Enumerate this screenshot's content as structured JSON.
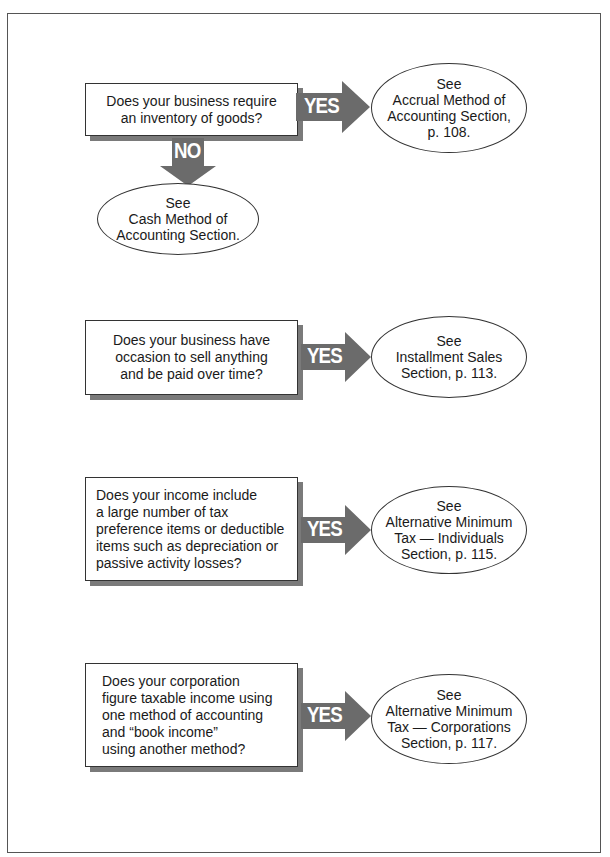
{
  "flowchart": {
    "nodes": [
      {
        "question": [
          "Does your business require",
          "an inventory of goods?"
        ],
        "yes_label": "YES",
        "yes_target": [
          "See",
          "Accrual Method of",
          "Accounting Section,",
          "p. 108."
        ],
        "no_label": "NO",
        "no_target": [
          "See",
          "Cash Method of",
          "Accounting Section."
        ]
      },
      {
        "question": [
          "Does your business have",
          "occasion to sell anything",
          "and be paid over time?"
        ],
        "yes_label": "YES",
        "yes_target": [
          "See",
          "Installment Sales",
          "Section, p. 113."
        ]
      },
      {
        "question": [
          "Does your income include",
          "a large number of tax",
          "preference items or deductible",
          "items such as depreciation or",
          "passive activity losses?"
        ],
        "yes_label": "YES",
        "yes_target": [
          "See",
          "Alternative Minimum",
          "Tax — Individuals",
          "Section, p. 115."
        ]
      },
      {
        "question": [
          "Does your corporation",
          "figure taxable income using",
          "one method of accounting",
          "and “book income”",
          "using another method?"
        ],
        "yes_label": "YES",
        "yes_target": [
          "See",
          "Alternative Minimum",
          "Tax — Corporations",
          "Section, p. 117."
        ]
      }
    ]
  },
  "colors": {
    "arrow_fill": "#6b6b6b",
    "shadow": "#7a7a7a",
    "border": "#333333"
  }
}
